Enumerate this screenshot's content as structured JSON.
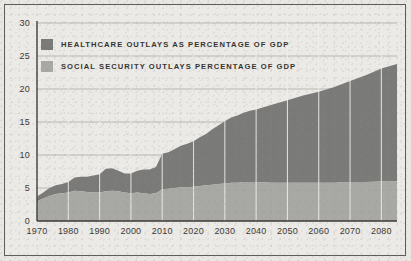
{
  "chart_data": {
    "type": "area",
    "title": "",
    "subtitle": "",
    "xlabel": "",
    "ylabel": "",
    "stacked": true,
    "grid": "horizontal-gridlines-plus-decade-verticals",
    "legend_position": "top-left-inside-plot",
    "xlim": [
      1970,
      2085
    ],
    "ylim": [
      0,
      30
    ],
    "ytick_step": 5,
    "yticks": [
      "0",
      "5",
      "10",
      "15",
      "20",
      "25",
      "30"
    ],
    "xticks": [
      "1970",
      "1980",
      "1990",
      "2000",
      "2010",
      "2020",
      "2030",
      "2040",
      "2050",
      "2060",
      "2070",
      "2080"
    ],
    "series": [
      {
        "name": "SOCIAL SECURITY OUTLAYS PERCENTAGE OF GDP",
        "color": "#a8a8a4",
        "stack_order": 1,
        "x": [
          1970,
          1972,
          1974,
          1976,
          1978,
          1980,
          1982,
          1984,
          1986,
          1988,
          1990,
          1992,
          1994,
          1996,
          1998,
          2000,
          2002,
          2004,
          2006,
          2008,
          2010,
          2012,
          2014,
          2016,
          2018,
          2020,
          2022,
          2024,
          2026,
          2028,
          2030,
          2032,
          2034,
          2036,
          2038,
          2040,
          2045,
          2050,
          2055,
          2060,
          2065,
          2070,
          2075,
          2080,
          2085
        ],
        "values": [
          3.0,
          3.4,
          3.8,
          4.1,
          4.2,
          4.3,
          4.6,
          4.5,
          4.4,
          4.3,
          4.3,
          4.5,
          4.6,
          4.5,
          4.3,
          4.2,
          4.3,
          4.2,
          4.1,
          4.2,
          4.8,
          4.9,
          5.0,
          5.1,
          5.1,
          5.2,
          5.3,
          5.4,
          5.5,
          5.6,
          5.7,
          5.8,
          5.8,
          5.9,
          5.9,
          5.9,
          5.8,
          5.8,
          5.8,
          5.8,
          5.8,
          5.9,
          5.9,
          6.0,
          6.0
        ]
      },
      {
        "name": "HEALTHCARE OUTLAYS AS PERCENTAGE OF GDP",
        "color": "#7a7a78",
        "stack_order": 2,
        "x": [
          1970,
          1972,
          1974,
          1976,
          1978,
          1980,
          1982,
          1984,
          1986,
          1988,
          1990,
          1992,
          1994,
          1996,
          1998,
          2000,
          2002,
          2004,
          2006,
          2008,
          2010,
          2012,
          2014,
          2016,
          2018,
          2020,
          2022,
          2024,
          2026,
          2028,
          2030,
          2032,
          2034,
          2036,
          2038,
          2040,
          2045,
          2050,
          2055,
          2060,
          2065,
          2070,
          2075,
          2080,
          2085
        ],
        "values": [
          0.7,
          0.9,
          1.2,
          1.3,
          1.4,
          1.6,
          2.0,
          2.2,
          2.3,
          2.6,
          2.8,
          3.4,
          3.4,
          3.1,
          2.9,
          3.0,
          3.3,
          3.6,
          3.7,
          4.0,
          5.4,
          5.5,
          5.9,
          6.3,
          6.6,
          6.9,
          7.4,
          7.8,
          8.4,
          8.9,
          9.4,
          9.9,
          10.2,
          10.5,
          10.8,
          11.0,
          11.8,
          12.5,
          13.2,
          13.8,
          14.5,
          15.3,
          16.2,
          17.1,
          17.8
        ]
      }
    ],
    "totals_note": "Top of stacked area reaches about 24 percent of GDP by 2085",
    "annotations": []
  },
  "legend": {
    "items": [
      {
        "label": "HEALTHCARE OUTLAYS AS PERCENTAGE OF GDP",
        "color": "#7a7a78",
        "swatch_class": "hc"
      },
      {
        "label": "SOCIAL SECURITY OUTLAYS PERCENTAGE OF GDP",
        "color": "#a8a8a4",
        "swatch_class": "ss"
      }
    ]
  },
  "colors": {
    "background": "#e9e7e3",
    "panel": "#eceae6",
    "border": "#5e5c58",
    "healthcare": "#7a7a78",
    "social_security": "#a8a8a4",
    "gridline": "#b9b6b0",
    "axis": "#3b3935",
    "text": "#35332f"
  }
}
